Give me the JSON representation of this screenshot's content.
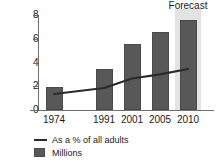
{
  "chart_data": {
    "type": "bar",
    "title": "",
    "subtitle": "",
    "xlabel": "",
    "ylabel": "",
    "categories": [
      "1974",
      "1991",
      "2001",
      "2005",
      "2010"
    ],
    "ylim": [
      0,
      8
    ],
    "yticks": [
      "0",
      "2",
      "4",
      "6",
      "8"
    ],
    "ytick_values": [
      0,
      2,
      4,
      6,
      8
    ],
    "grid": false,
    "legend_position": "bottom-left",
    "series": [
      {
        "name": "Millions",
        "type": "bar",
        "color": "#585858",
        "values": [
          1.9,
          3.45,
          5.6,
          6.55,
          7.6
        ]
      },
      {
        "name": "As a % of all adults",
        "type": "line",
        "color": "#2b2b2b",
        "values": [
          1.35,
          1.85,
          2.65,
          3.0,
          3.45
        ]
      }
    ],
    "annotations": [
      {
        "name": "forecast-band",
        "label": "Forecast",
        "categories": [
          "2010"
        ],
        "color": "#e3e3e3"
      }
    ]
  },
  "legend": {
    "items": [
      {
        "label": "As a % of all adults",
        "marker": "line-swatch"
      },
      {
        "label": "Millions",
        "marker": "box-swatch"
      }
    ]
  },
  "colors": {
    "bar": "#585858",
    "line": "#2b2b2b",
    "axis": "#6f6f6f",
    "forecast_band": "#e3e3e3",
    "background": "#ffffff",
    "text": "#1a1a1a"
  }
}
